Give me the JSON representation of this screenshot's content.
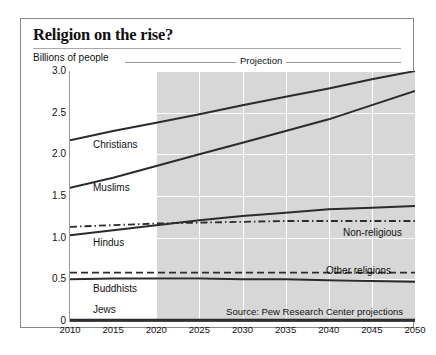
{
  "title": "Religion on the rise?",
  "axis_note": "Billions of people",
  "projection_label": "Projection",
  "source": "Source: Pew Research Center projections",
  "chart_data": {
    "type": "line",
    "title": "Religion on the rise?",
    "xlabel": "",
    "ylabel": "Billions of people",
    "xlim": [
      2010,
      2050
    ],
    "ylim": [
      0,
      3.0
    ],
    "yticks": [
      "0",
      "0.5",
      "1.0",
      "1.5",
      "2.0",
      "2.5",
      "3.0"
    ],
    "ytick_values": [
      0,
      0.5,
      1.0,
      1.5,
      2.0,
      2.5,
      3.0
    ],
    "xticks": [
      "2010",
      "2015",
      "2020",
      "2025",
      "2030",
      "2035",
      "2040",
      "2045",
      "2050"
    ],
    "x": [
      2010,
      2015,
      2020,
      2025,
      2030,
      2035,
      2040,
      2045,
      2050
    ],
    "grid": true,
    "legend": "inline-labels",
    "projection_start": 2020,
    "annotations": [
      "Billions of people",
      "Projection"
    ],
    "series": [
      {
        "name": "Christians",
        "style": "solid",
        "values": [
          2.17,
          2.28,
          2.38,
          2.48,
          2.59,
          2.69,
          2.79,
          2.9,
          3.0
        ]
      },
      {
        "name": "Muslims",
        "style": "solid",
        "values": [
          1.6,
          1.72,
          1.86,
          2.0,
          2.14,
          2.28,
          2.42,
          2.59,
          2.76
        ]
      },
      {
        "name": "Non-religious",
        "style": "dashdot",
        "values": [
          1.13,
          1.15,
          1.17,
          1.18,
          1.19,
          1.2,
          1.2,
          1.2,
          1.2
        ]
      },
      {
        "name": "Hindus",
        "style": "solid",
        "values": [
          1.03,
          1.09,
          1.15,
          1.21,
          1.26,
          1.3,
          1.34,
          1.36,
          1.38
        ]
      },
      {
        "name": "Other religions",
        "style": "dashed",
        "values": [
          0.58,
          0.58,
          0.58,
          0.58,
          0.58,
          0.58,
          0.58,
          0.58,
          0.58
        ]
      },
      {
        "name": "Buddhists",
        "style": "solid",
        "values": [
          0.5,
          0.51,
          0.51,
          0.51,
          0.5,
          0.5,
          0.49,
          0.48,
          0.47
        ]
      },
      {
        "name": "Jews",
        "style": "solid",
        "values": [
          0.014,
          0.014,
          0.015,
          0.015,
          0.016,
          0.016,
          0.016,
          0.016,
          0.016
        ]
      }
    ],
    "series_labels": [
      {
        "name": "Christians",
        "x": 72,
        "y": 120
      },
      {
        "name": "Muslims",
        "x": 72,
        "y": 163
      },
      {
        "name": "Hindus",
        "x": 72,
        "y": 218
      },
      {
        "name": "Non-religious",
        "x": 322,
        "y": 208
      },
      {
        "name": "Other religions",
        "x": 305,
        "y": 246
      },
      {
        "name": "Buddhists",
        "x": 72,
        "y": 264
      },
      {
        "name": "Jews",
        "x": 72,
        "y": 285
      }
    ]
  },
  "colors": {
    "line": "#2b2b2b",
    "shade": "#d7d7d7",
    "grid": "#ffffff",
    "frame": "#8a8a8a",
    "text": "#111111"
  }
}
